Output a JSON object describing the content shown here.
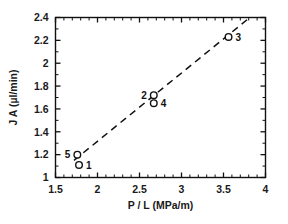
{
  "chart_data": {
    "type": "scatter",
    "title": "",
    "xlabel": "P / L (MPa/m)",
    "ylabel": "J A (µl/min)",
    "xlim": [
      1.5,
      4
    ],
    "ylim": [
      1,
      2.4
    ],
    "grid": false,
    "legend": "none",
    "xticks": [
      "1.5",
      "2",
      "2.5",
      "3",
      "3.5",
      "4"
    ],
    "xtick_values": [
      1.5,
      2,
      2.5,
      3,
      3.5,
      4
    ],
    "xminor_per_interval": 4,
    "yticks": [
      "1",
      "1.2",
      "1.4",
      "1.6",
      "1.8",
      "2",
      "2.2",
      "2.4"
    ],
    "ytick_values": [
      1,
      1.2,
      1.4,
      1.6,
      1.8,
      2,
      2.2,
      2.4
    ],
    "yminor_per_interval": 1,
    "marker": "open-circle",
    "points": [
      {
        "label": "5",
        "x": 1.76,
        "y": 1.2,
        "label_side": "left"
      },
      {
        "label": "1",
        "x": 1.78,
        "y": 1.11,
        "label_side": "right"
      },
      {
        "label": "2",
        "x": 2.67,
        "y": 1.72,
        "label_side": "left"
      },
      {
        "label": "4",
        "x": 2.67,
        "y": 1.65,
        "label_side": "right"
      },
      {
        "label": "3",
        "x": 3.56,
        "y": 2.23,
        "label_side": "right"
      }
    ],
    "trendline": {
      "style": "dashed",
      "x_start": 1.72,
      "y_start": 1.15,
      "x_end": 3.78,
      "y_end": 2.38
    },
    "colors": {
      "axis": "#111111",
      "marker_edge": "#111111",
      "marker_fill": "#ffffff",
      "trendline": "#111111",
      "background": "#ffffff"
    }
  }
}
